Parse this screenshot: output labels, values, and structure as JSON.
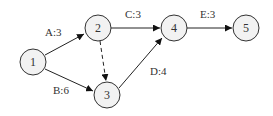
{
  "diagram": {
    "type": "activity-network",
    "nodes": [
      {
        "id": "1",
        "label": "1",
        "x": 33,
        "y": 62
      },
      {
        "id": "2",
        "label": "2",
        "x": 98,
        "y": 28
      },
      {
        "id": "3",
        "label": "3",
        "x": 107,
        "y": 95
      },
      {
        "id": "4",
        "label": "4",
        "x": 174,
        "y": 28
      },
      {
        "id": "5",
        "label": "5",
        "x": 246,
        "y": 28
      }
    ],
    "edges": [
      {
        "from": "1",
        "to": "2",
        "label": "A:3",
        "style": "solid"
      },
      {
        "from": "1",
        "to": "3",
        "label": "B:6",
        "style": "solid"
      },
      {
        "from": "2",
        "to": "4",
        "label": "C:3",
        "style": "solid"
      },
      {
        "from": "3",
        "to": "4",
        "label": "D:4",
        "style": "solid"
      },
      {
        "from": "4",
        "to": "5",
        "label": "E:3",
        "style": "solid"
      },
      {
        "from": "2",
        "to": "3",
        "label": "",
        "style": "dashed"
      }
    ]
  }
}
